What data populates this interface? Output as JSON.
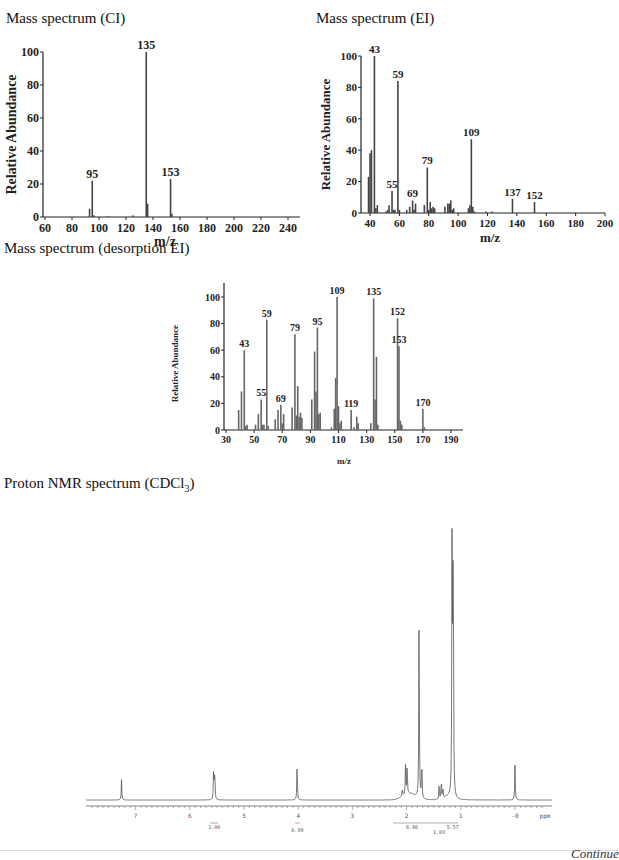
{
  "page": {
    "continued_label": "Continued"
  },
  "chart_data": [
    {
      "id": "ci",
      "type": "bar",
      "title": "Mass spectrum (CI)",
      "xlabel": "m/z",
      "ylabel": "Relative Abundance",
      "xlim": [
        60,
        245
      ],
      "ylim": [
        0,
        100
      ],
      "xticks": [
        60,
        80,
        100,
        120,
        140,
        160,
        180,
        200,
        220,
        240
      ],
      "yticks": [
        0,
        20,
        40,
        60,
        80,
        100
      ],
      "peaks": [
        {
          "x": 93,
          "y": 5
        },
        {
          "x": 95,
          "y": 22,
          "label": "95"
        },
        {
          "x": 96,
          "y": 1
        },
        {
          "x": 107,
          "y": 0.5
        },
        {
          "x": 125,
          "y": 1
        },
        {
          "x": 135,
          "y": 100,
          "label": "135"
        },
        {
          "x": 136,
          "y": 8
        },
        {
          "x": 153,
          "y": 23,
          "label": "153"
        },
        {
          "x": 154,
          "y": 2
        }
      ]
    },
    {
      "id": "ei",
      "type": "bar",
      "title": "Mass spectrum (EI)",
      "xlabel": "m/z",
      "ylabel": "Relative Abundance",
      "xlim": [
        35,
        200
      ],
      "ylim": [
        0,
        100
      ],
      "xticks": [
        40,
        60,
        80,
        100,
        120,
        140,
        160,
        180,
        200
      ],
      "yticks": [
        0,
        20,
        40,
        60,
        80,
        100
      ],
      "peaks": [
        {
          "x": 39,
          "y": 23
        },
        {
          "x": 40,
          "y": 38
        },
        {
          "x": 41,
          "y": 40
        },
        {
          "x": 43,
          "y": 100,
          "label": "43"
        },
        {
          "x": 44,
          "y": 3
        },
        {
          "x": 45,
          "y": 5
        },
        {
          "x": 51,
          "y": 1
        },
        {
          "x": 52,
          "y": 2
        },
        {
          "x": 53,
          "y": 5
        },
        {
          "x": 55,
          "y": 14,
          "label": "55"
        },
        {
          "x": 56,
          "y": 2
        },
        {
          "x": 57,
          "y": 2
        },
        {
          "x": 59,
          "y": 84,
          "label": "59"
        },
        {
          "x": 60,
          "y": 2
        },
        {
          "x": 65,
          "y": 2
        },
        {
          "x": 67,
          "y": 4
        },
        {
          "x": 69,
          "y": 8,
          "label": "69"
        },
        {
          "x": 70,
          "y": 2
        },
        {
          "x": 71,
          "y": 6
        },
        {
          "x": 77,
          "y": 5
        },
        {
          "x": 79,
          "y": 29,
          "label": "79"
        },
        {
          "x": 80,
          "y": 2
        },
        {
          "x": 81,
          "y": 7
        },
        {
          "x": 82,
          "y": 3
        },
        {
          "x": 83,
          "y": 4
        },
        {
          "x": 84,
          "y": 3
        },
        {
          "x": 91,
          "y": 4
        },
        {
          "x": 93,
          "y": 6
        },
        {
          "x": 94,
          "y": 6
        },
        {
          "x": 95,
          "y": 8
        },
        {
          "x": 96,
          "y": 2
        },
        {
          "x": 97,
          "y": 3
        },
        {
          "x": 107,
          "y": 3
        },
        {
          "x": 108,
          "y": 5
        },
        {
          "x": 109,
          "y": 47,
          "label": "109"
        },
        {
          "x": 110,
          "y": 4
        },
        {
          "x": 111,
          "y": 1
        },
        {
          "x": 119,
          "y": 1
        },
        {
          "x": 123,
          "y": 1
        },
        {
          "x": 137,
          "y": 9,
          "label": "137"
        },
        {
          "x": 152,
          "y": 7,
          "label": "152"
        }
      ]
    },
    {
      "id": "desorption-ei",
      "type": "bar",
      "title": "Mass spectrum (desorption EI)",
      "xlabel": "m/z",
      "ylabel": "Relative Abundance",
      "xlim": [
        30,
        200
      ],
      "ylim": [
        0,
        110
      ],
      "xticks": [
        30,
        50,
        70,
        90,
        110,
        130,
        150,
        170,
        190
      ],
      "yticks": [
        0,
        20,
        40,
        60,
        80,
        100
      ],
      "peaks": [
        {
          "x": 39,
          "y": 15
        },
        {
          "x": 41,
          "y": 29
        },
        {
          "x": 43,
          "y": 60,
          "label": "43"
        },
        {
          "x": 44,
          "y": 3
        },
        {
          "x": 45,
          "y": 4
        },
        {
          "x": 51,
          "y": 4
        },
        {
          "x": 53,
          "y": 12
        },
        {
          "x": 55,
          "y": 23,
          "label": "55"
        },
        {
          "x": 56,
          "y": 4
        },
        {
          "x": 57,
          "y": 4
        },
        {
          "x": 59,
          "y": 83,
          "label": "59"
        },
        {
          "x": 60,
          "y": 3
        },
        {
          "x": 65,
          "y": 8
        },
        {
          "x": 67,
          "y": 15
        },
        {
          "x": 69,
          "y": 19,
          "label": "69"
        },
        {
          "x": 70,
          "y": 5
        },
        {
          "x": 71,
          "y": 12
        },
        {
          "x": 77,
          "y": 17
        },
        {
          "x": 79,
          "y": 72,
          "label": "79"
        },
        {
          "x": 80,
          "y": 11
        },
        {
          "x": 81,
          "y": 33
        },
        {
          "x": 82,
          "y": 10
        },
        {
          "x": 83,
          "y": 13
        },
        {
          "x": 84,
          "y": 9
        },
        {
          "x": 91,
          "y": 23
        },
        {
          "x": 93,
          "y": 59
        },
        {
          "x": 94,
          "y": 29
        },
        {
          "x": 95,
          "y": 77,
          "label": "95"
        },
        {
          "x": 96,
          "y": 12
        },
        {
          "x": 97,
          "y": 13
        },
        {
          "x": 105,
          "y": 2
        },
        {
          "x": 107,
          "y": 16
        },
        {
          "x": 108,
          "y": 39
        },
        {
          "x": 109,
          "y": 100,
          "label": "109"
        },
        {
          "x": 110,
          "y": 18
        },
        {
          "x": 111,
          "y": 5
        },
        {
          "x": 112,
          "y": 7
        },
        {
          "x": 119,
          "y": 15,
          "label": "119"
        },
        {
          "x": 121,
          "y": 2
        },
        {
          "x": 123,
          "y": 10
        },
        {
          "x": 124,
          "y": 5
        },
        {
          "x": 133,
          "y": 5
        },
        {
          "x": 135,
          "y": 99,
          "label": "135"
        },
        {
          "x": 136,
          "y": 23
        },
        {
          "x": 137,
          "y": 55
        },
        {
          "x": 138,
          "y": 4
        },
        {
          "x": 152,
          "y": 84,
          "label": "152"
        },
        {
          "x": 153,
          "y": 63,
          "label": "153"
        },
        {
          "x": 154,
          "y": 7
        },
        {
          "x": 155,
          "y": 4
        },
        {
          "x": 170,
          "y": 16,
          "label": "170"
        },
        {
          "x": 171,
          "y": 2
        }
      ]
    },
    {
      "id": "nmr",
      "type": "line",
      "title_prefix": "Proton NMR spectrum (CDCl",
      "title_sub": "3",
      "title_suffix": ")",
      "xlabel": "ppm",
      "xlim": [
        7.9,
        -0.6
      ],
      "xticks": [
        7,
        6,
        5,
        4,
        3,
        2,
        1,
        0
      ],
      "xtick_labels": [
        "7",
        "6",
        "5",
        "4",
        "3",
        "2",
        "1",
        "-0"
      ],
      "peaks": [
        {
          "ppm": 7.26,
          "height": 7
        },
        {
          "ppm": 5.56,
          "height": 11
        },
        {
          "ppm": 5.54,
          "height": 11
        },
        {
          "ppm": 4.02,
          "height": 12
        },
        {
          "ppm": 2.08,
          "height": 3
        },
        {
          "ppm": 2.02,
          "height": 10
        },
        {
          "ppm": 1.99,
          "height": 10
        },
        {
          "ppm": 1.77,
          "height": 60
        },
        {
          "ppm": 1.72,
          "height": 14
        },
        {
          "ppm": 1.4,
          "height": 5
        },
        {
          "ppm": 1.36,
          "height": 7
        },
        {
          "ppm": 1.33,
          "height": 3
        },
        {
          "ppm": 1.16,
          "height": 100
        },
        {
          "ppm": 1.14,
          "height": 100
        },
        {
          "ppm": 0.0,
          "height": 12
        }
      ],
      "integrals": [
        {
          "from": 5.62,
          "to": 5.48,
          "value": "1.00"
        },
        {
          "from": 4.06,
          "to": 3.97,
          "value": "0.99"
        },
        {
          "from": 2.25,
          "to": 1.55,
          "value": "8.96"
        },
        {
          "from": 1.55,
          "to": 1.25,
          "value": "1.03"
        },
        {
          "from": 1.25,
          "to": 1.05,
          "value": "5.57"
        }
      ]
    }
  ]
}
